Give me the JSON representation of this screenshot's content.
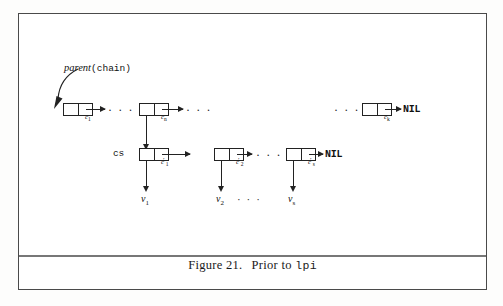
{
  "figure": {
    "caption_prefix": "Figure 21.",
    "caption_text": "Prior to",
    "caption_code": "lpi",
    "frame_color": "#4a4a4a",
    "ink_color": "#222222",
    "background": "#ffffff"
  },
  "annotations": {
    "parent_italic": "parent",
    "parent_mono": "(chain)",
    "cs_label": "cs"
  },
  "chain_row": {
    "nodes": [
      {
        "label": "c",
        "sub": "1",
        "prime": ""
      },
      {
        "label": "c",
        "sub": "n",
        "prime": ""
      },
      {
        "label": "c",
        "sub": "k",
        "prime": ""
      }
    ],
    "ellipsis_1": "· · ·",
    "ellipsis_2": "· · ·",
    "ellipsis_3": "· · ·",
    "terminator": "NIL"
  },
  "cs_row": {
    "nodes": [
      {
        "label": "c",
        "sub": "1",
        "prime": "′"
      },
      {
        "label": "c",
        "sub": "2",
        "prime": "′"
      },
      {
        "label": "c",
        "sub": "s",
        "prime": "′"
      }
    ],
    "ellipsis_1": "· · ·",
    "terminator": "NIL"
  },
  "value_row": {
    "labels": [
      {
        "label": "v",
        "sub": "1"
      },
      {
        "label": "v",
        "sub": "2"
      },
      {
        "label": "v",
        "sub": "s"
      }
    ],
    "ellipsis_1": "· · ·"
  }
}
